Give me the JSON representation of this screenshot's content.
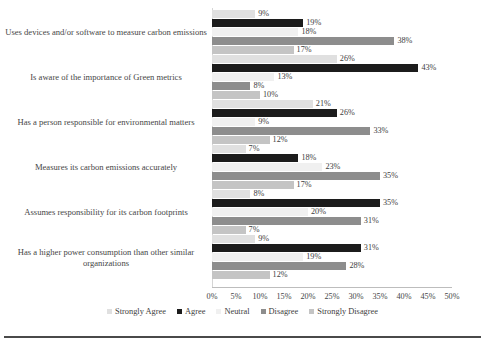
{
  "chart_data": {
    "type": "bar",
    "orientation": "horizontal",
    "title": "",
    "subtitle": "",
    "xlabel": "",
    "ylabel": "",
    "xlim": [
      0,
      50
    ],
    "grid": false,
    "legend_position": "bottom",
    "axis_tick_labels": [
      "0%",
      "5%",
      "10%",
      "15%",
      "20%",
      "25%",
      "30%",
      "35%",
      "40%",
      "45%",
      "50%"
    ],
    "axis_tick_values": [
      0,
      5,
      10,
      15,
      20,
      25,
      30,
      35,
      40,
      45,
      50
    ],
    "value_suffix": "%",
    "categories": [
      "Uses devices and/or software to measure carbon emissions",
      "Is aware of the importance of Green metrics",
      "Has a person responsible for environmental matters",
      "Measures its carbon emissions accurately",
      "Assumes responsibility for its carbon footprints",
      "Has a higher power consumption than other similar organizations"
    ],
    "series": [
      {
        "name": "Strongly Agree",
        "color": "#e0e0e0",
        "values": [
          9,
          26,
          21,
          7,
          8,
          9
        ]
      },
      {
        "name": "Agree",
        "color": "#1c1c1c",
        "values": [
          19,
          43,
          26,
          18,
          35,
          31
        ]
      },
      {
        "name": "Neutral",
        "color": "#f0f0f0",
        "values": [
          18,
          13,
          9,
          23,
          20,
          19
        ]
      },
      {
        "name": "Disagree",
        "color": "#8d8d8d",
        "values": [
          38,
          8,
          33,
          35,
          31,
          28
        ]
      },
      {
        "name": "Strongly Disagree",
        "color": "#c4c4c4",
        "values": [
          17,
          10,
          12,
          17,
          7,
          12
        ]
      }
    ],
    "data_labels": [
      [
        "9%",
        "19%",
        "18%",
        "38%",
        "17%"
      ],
      [
        "26%",
        "43%",
        "13%",
        "8%",
        "10%"
      ],
      [
        "21%",
        "26%",
        "9%",
        "33%",
        "12%"
      ],
      [
        "7%",
        "18%",
        "23%",
        "35%",
        "17%"
      ],
      [
        "8%",
        "35%",
        "20%",
        "31%",
        "7%"
      ],
      [
        "9%",
        "31%",
        "19%",
        "28%",
        "12%"
      ]
    ]
  }
}
